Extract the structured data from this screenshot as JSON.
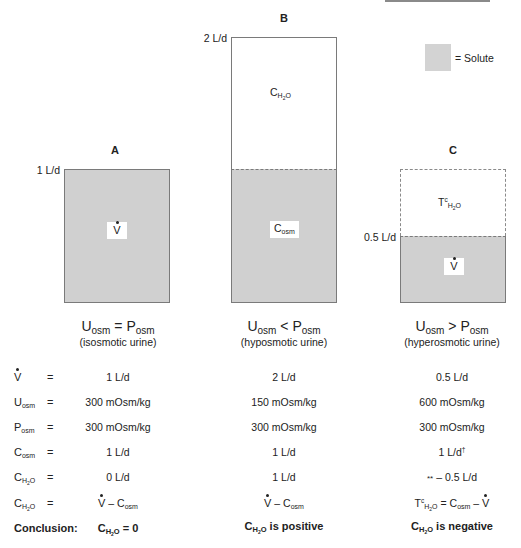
{
  "legend": {
    "swatch_color": "#d3d3d3",
    "label": "= Solute"
  },
  "panels": [
    {
      "letter": "A",
      "axis_label": "1 L/d",
      "box_labels": {
        "solute": "V"
      },
      "relation": {
        "u": "U",
        "u_sub": "osm",
        "op": "=",
        "p": "P",
        "p_sub": "osm"
      },
      "description": "(isosmotic urine)"
    },
    {
      "letter": "B",
      "axis_label": "2 L/d",
      "box_labels": {
        "water": "C",
        "water_sub": "H2O",
        "solute": "C",
        "solute_sub": "osm"
      },
      "relation": {
        "u": "U",
        "u_sub": "osm",
        "op": "<",
        "p": "P",
        "p_sub": "osm"
      },
      "description": "(hyposmotic urine)"
    },
    {
      "letter": "C",
      "axis_label": "0.5 L/d",
      "box_labels": {
        "water": "T",
        "water_sup": "c",
        "water_sub": "H2O",
        "solute": "V"
      },
      "relation": {
        "u": "U",
        "u_sub": "osm",
        "op": ">",
        "p": "P",
        "p_sub": "osm"
      },
      "description": "(hyperosmotic urine)"
    }
  ],
  "table": {
    "rows": [
      {
        "label": "V",
        "label_sub": "",
        "eq": "=",
        "values": [
          "1 L/d",
          "2 L/d",
          "0.5 L/d"
        ]
      },
      {
        "label": "U",
        "label_sub": "osm",
        "eq": "=",
        "values": [
          "300 mOsm/kg",
          "150 mOsm/kg",
          "600 mOsm/kg"
        ]
      },
      {
        "label": "P",
        "label_sub": "osm",
        "eq": "=",
        "values": [
          "300 mOsm/kg",
          "300 mOsm/kg",
          "300 mOsm/kg"
        ]
      },
      {
        "label": "C",
        "label_sub": "osm",
        "eq": "=",
        "values": [
          "1 L/d",
          "1 L/d",
          "1 L/d"
        ],
        "c_suffix": "†"
      },
      {
        "label": "C",
        "label_sub": "H2O",
        "eq": "=",
        "values": [
          "0 L/d",
          "1 L/d",
          "– 0.5 L/d"
        ],
        "c_prefix": "**"
      },
      {
        "label": "C",
        "label_sub": "H2O",
        "eq": "=",
        "formulas": [
          "V – C osm",
          "V – C osm",
          "TcH2O = Cosm – V"
        ]
      }
    ],
    "conclusion": {
      "label": "Conclusion:",
      "values": [
        "CH2O = 0",
        "CH2O is positive",
        "CH2O is negative"
      ],
      "parts": [
        {
          "pre": "C",
          "sub": "H2O",
          "post": " = 0"
        },
        {
          "pre": "C",
          "sub": "H2O",
          "post": " is positive"
        },
        {
          "pre": "C",
          "sub": "H2O",
          "post": " is negative"
        }
      ]
    }
  },
  "strings": {
    "minus": "–",
    "osm": "osm",
    "h2o": "H",
    "h2o_2": "2",
    "h2o_o": "O"
  }
}
